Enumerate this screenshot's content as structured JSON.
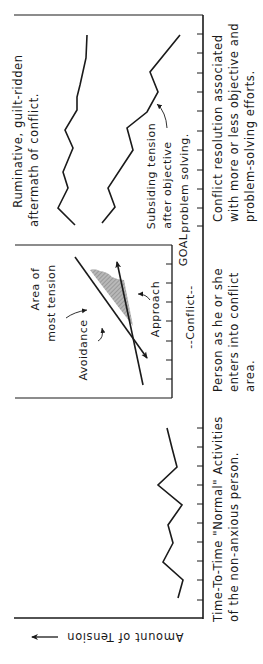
{
  "diagram": {
    "orientation": "rotated-90-ccw",
    "y_axis_label": "Amount of Tension",
    "panels": [
      {
        "id": "normal",
        "caption_lines": [
          "Time-To-Time \"Normal\" Activities",
          "of the non-anxious person."
        ]
      },
      {
        "id": "conflict",
        "caption_lines": [
          "Person as he or she",
          "enters into conflict",
          "area."
        ],
        "inset": {
          "area_label_lines": [
            "Area of",
            "most tension"
          ],
          "avoidance_label": "Avoidance",
          "approach_label": "Approach",
          "goal_label": "GOAL",
          "conflict_label": "--Conflict--"
        }
      },
      {
        "id": "resolution",
        "caption_lines": [
          "Conflict resolution associated",
          "with more or less objective and",
          "problem-solving efforts."
        ],
        "upper_curve_label_lines": [
          "Ruminative, guilt-ridden",
          "aftermath of conflict."
        ],
        "lower_curve_label_lines": [
          "Subsiding tension",
          "after objective",
          "problem solving."
        ]
      }
    ],
    "colors": {
      "ink": "#1a1a1a",
      "shade": "#9a9a9a",
      "background": "#ffffff"
    }
  }
}
